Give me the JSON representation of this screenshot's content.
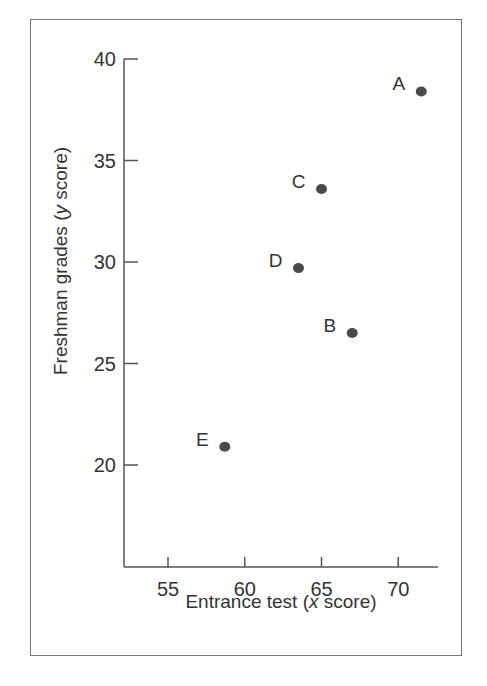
{
  "chart_data": {
    "type": "scatter",
    "title": "",
    "xlabel": "Entrance test (x score)",
    "xlabel_parts": {
      "pre": "Entrance test (",
      "italic": "x",
      "post": " score)"
    },
    "ylabel": "Freshman grades (y score)",
    "ylabel_parts": {
      "pre": "Freshman grades (",
      "italic": "y",
      "post": " score)"
    },
    "xlim": [
      52.5,
      72.5
    ],
    "ylim": [
      15,
      40
    ],
    "xticks": [
      55,
      60,
      65,
      70
    ],
    "yticks": [
      20,
      25,
      30,
      35,
      40
    ],
    "grid": false,
    "legend": null,
    "points": [
      {
        "label": "A",
        "x": 71.5,
        "y": 38.4
      },
      {
        "label": "B",
        "x": 67.0,
        "y": 26.5
      },
      {
        "label": "C",
        "x": 65.0,
        "y": 33.6
      },
      {
        "label": "D",
        "x": 63.5,
        "y": 29.7
      },
      {
        "label": "E",
        "x": 58.7,
        "y": 20.9
      }
    ],
    "marker_color": "#4a4a4a"
  }
}
